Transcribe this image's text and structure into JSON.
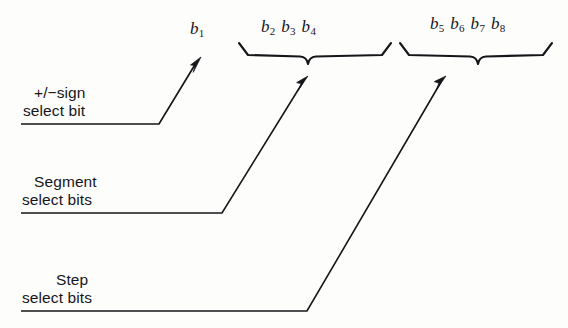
{
  "figure": {
    "background_color": "#fdfdfc",
    "ink_color": "#16161a",
    "width": 568,
    "height": 328
  },
  "bit_groups": [
    {
      "id": "sign-bit",
      "bits": [
        "b1"
      ],
      "label_html_plain": "b1",
      "has_brace": false,
      "source_label_lines": [
        "+/−sign",
        "select bit"
      ]
    },
    {
      "id": "segment-bits",
      "bits": [
        "b2",
        "b3",
        "b4"
      ],
      "label_html_plain": "b2 b3 b4",
      "has_brace": true,
      "source_label_lines": [
        "Segment",
        "select bits"
      ]
    },
    {
      "id": "step-bits",
      "bits": [
        "b5",
        "b6",
        "b7",
        "b8"
      ],
      "label_html_plain": "b5 b6 b7 b8",
      "has_brace": true,
      "source_label_lines": [
        "Step",
        "select bits"
      ]
    }
  ],
  "bit_labels": {
    "b1": {
      "base": "b",
      "sub": "1"
    },
    "b2": {
      "base": "b",
      "sub": "2"
    },
    "b3": {
      "base": "b",
      "sub": "3"
    },
    "b4": {
      "base": "b",
      "sub": "4"
    },
    "b5": {
      "base": "b",
      "sub": "5"
    },
    "b6": {
      "base": "b",
      "sub": "6"
    },
    "b7": {
      "base": "b",
      "sub": "7"
    },
    "b8": {
      "base": "b",
      "sub": "8"
    }
  },
  "callouts": [
    {
      "id": "sign",
      "line1": "+/−sign",
      "line2": "select bit",
      "underline_y": 124,
      "underline_x1": 21,
      "underline_x2": 159,
      "arrow_tip_x": 201,
      "arrow_tip_y": 57
    },
    {
      "id": "segment",
      "line1": "Segment",
      "line2": "select bits",
      "underline_y": 213,
      "underline_x1": 21,
      "underline_x2": 222,
      "arrow_tip_x": 308,
      "arrow_tip_y": 76
    },
    {
      "id": "step",
      "line1": "Step",
      "line2": "select bits",
      "underline_y": 311,
      "underline_x1": 21,
      "underline_x2": 307,
      "arrow_tip_x": 446,
      "arrow_tip_y": 76
    }
  ],
  "braces": [
    {
      "id": "segment-brace",
      "x_left": 239,
      "x_right": 391,
      "y_top": 43,
      "y_bar": 57,
      "x_center": 308
    },
    {
      "id": "step-brace",
      "x_left": 400,
      "x_right": 552,
      "y_top": 43,
      "y_bar": 57,
      "x_center": 478
    }
  ]
}
